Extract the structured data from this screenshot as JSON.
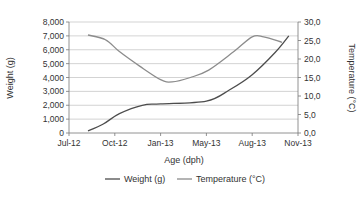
{
  "chart_data": {
    "type": "line",
    "title": "",
    "xlabel": "Age (dph)",
    "ylabel": "Weight (g)",
    "y2label": "Temperature (°C)",
    "x_ticks": [
      "Jul-12",
      "Oct-12",
      "Jan-13",
      "May-13",
      "Aug-13",
      "Nov-13"
    ],
    "y_ticks": [
      "0",
      "1,000",
      "2,000",
      "3,000",
      "4,000",
      "5,000",
      "6,000",
      "7,000",
      "8,000"
    ],
    "y2_ticks": [
      "0,0",
      "5,0",
      "10,0",
      "15,0",
      "20,0",
      "25,0",
      "30,0"
    ],
    "ylim": [
      0,
      8000
    ],
    "y2lim": [
      0,
      30
    ],
    "grid": true,
    "legend_position": "bottom",
    "series": [
      {
        "name": "Weight (g)",
        "axis": "left",
        "color": "#4d4d4d",
        "x_frac": [
          0.083,
          0.15,
          0.22,
          0.32,
          0.4,
          0.6,
          0.7,
          0.8,
          0.9,
          0.96
        ],
        "values": [
          150,
          650,
          1400,
          2000,
          2100,
          2300,
          3100,
          4200,
          5800,
          7000
        ]
      },
      {
        "name": "Temperature (°C)",
        "axis": "right",
        "color": "#8c8c8c",
        "x_frac": [
          0.083,
          0.16,
          0.22,
          0.31,
          0.4,
          0.45,
          0.53,
          0.61,
          0.72,
          0.8,
          0.85,
          0.93
        ],
        "values": [
          26.5,
          25.2,
          22.0,
          18.0,
          14.4,
          13.8,
          15.0,
          17.0,
          22.0,
          26.0,
          26.0,
          24.5
        ]
      }
    ]
  }
}
